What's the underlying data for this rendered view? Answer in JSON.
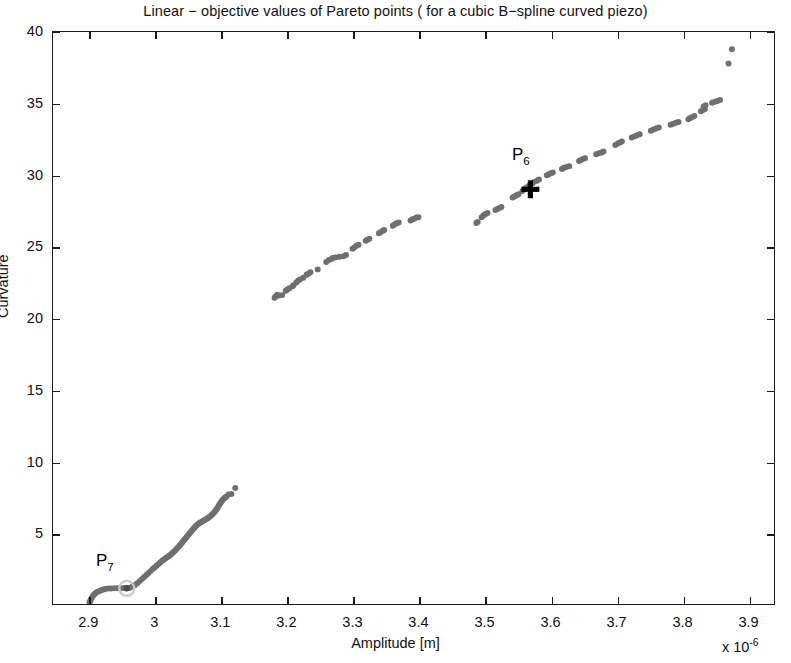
{
  "chart_data": {
    "type": "scatter",
    "title": "Linear − objective values of Pareto points ( for a cubic B−spline curved piezo)",
    "xlabel": "Amplitude [m]",
    "ylabel": "Curvature",
    "x_multiplier": "x 10",
    "x_multiplier_exponent": "-6",
    "xlim": [
      2.845,
      3.94
    ],
    "ylim": [
      0,
      40
    ],
    "xticks": [
      2.9,
      3.0,
      3.1,
      3.2,
      3.3,
      3.4,
      3.5,
      3.6,
      3.7,
      3.8,
      3.9
    ],
    "xtick_labels": [
      "2.9",
      "3",
      "3.1",
      "3.2",
      "3.3",
      "3.4",
      "3.5",
      "3.6",
      "3.7",
      "3.8",
      "3.9"
    ],
    "yticks": [
      5,
      10,
      15,
      20,
      25,
      30,
      35,
      40
    ],
    "ytick_labels": [
      "5",
      "10",
      "15",
      "20",
      "25",
      "30",
      "35",
      "40"
    ],
    "grid": false,
    "legend": null,
    "marker_color": "#6f6f6f",
    "marker_size": 3.0,
    "highlight_color": "#000000",
    "annotations": [
      {
        "label": "P",
        "subscript": "6",
        "x": 3.555,
        "y": 31.3,
        "marker_x": 3.57,
        "marker_y": 29.0,
        "marker_style": "plus"
      },
      {
        "label": "P",
        "subscript": "7",
        "x": 2.925,
        "y": 3.0,
        "marker_x": 2.957,
        "marker_y": 1.1,
        "marker_style": "circled-dot"
      }
    ],
    "series": [
      {
        "name": "lower-branch",
        "points": [
          [
            2.9005,
            0.1
          ],
          [
            2.9016,
            0.22
          ],
          [
            2.9028,
            0.33
          ],
          [
            2.9041,
            0.45
          ],
          [
            2.9058,
            0.58
          ],
          [
            2.9074,
            0.66
          ],
          [
            2.9092,
            0.74
          ],
          [
            2.9112,
            0.82
          ],
          [
            2.914,
            0.88
          ],
          [
            2.9172,
            0.95
          ],
          [
            2.9205,
            1.0
          ],
          [
            2.924,
            1.05
          ],
          [
            2.9285,
            1.08
          ],
          [
            2.933,
            1.09
          ],
          [
            2.938,
            1.1
          ],
          [
            2.943,
            1.1
          ],
          [
            2.948,
            1.11
          ],
          [
            2.953,
            1.12
          ],
          [
            2.957,
            1.11
          ],
          [
            2.961,
            1.12
          ],
          [
            2.965,
            1.2
          ],
          [
            2.969,
            1.32
          ],
          [
            2.973,
            1.45
          ],
          [
            2.9765,
            1.6
          ],
          [
            2.98,
            1.74
          ],
          [
            2.9835,
            1.88
          ],
          [
            2.9868,
            2.02
          ],
          [
            2.99,
            2.16
          ],
          [
            2.9932,
            2.3
          ],
          [
            2.9963,
            2.44
          ],
          [
            2.9994,
            2.56
          ],
          [
            3.0024,
            2.68
          ],
          [
            3.0053,
            2.8
          ],
          [
            3.0082,
            2.92
          ],
          [
            3.0108,
            3.02
          ],
          [
            3.0132,
            3.1
          ],
          [
            3.0155,
            3.18
          ],
          [
            3.0178,
            3.25
          ],
          [
            3.02,
            3.32
          ],
          [
            3.0222,
            3.4
          ],
          [
            3.0244,
            3.48
          ],
          [
            3.0266,
            3.58
          ],
          [
            3.0288,
            3.67
          ],
          [
            3.0308,
            3.76
          ],
          [
            3.0328,
            3.86
          ],
          [
            3.0347,
            3.96
          ],
          [
            3.0366,
            4.05
          ],
          [
            3.0384,
            4.15
          ],
          [
            3.0402,
            4.25
          ],
          [
            3.042,
            4.35
          ],
          [
            3.0438,
            4.45
          ],
          [
            3.0456,
            4.55
          ],
          [
            3.0474,
            4.65
          ],
          [
            3.0492,
            4.75
          ],
          [
            3.051,
            4.86
          ],
          [
            3.0528,
            4.96
          ],
          [
            3.0546,
            5.06
          ],
          [
            3.0563,
            5.16
          ],
          [
            3.058,
            5.25
          ],
          [
            3.0597,
            5.34
          ],
          [
            3.0614,
            5.42
          ],
          [
            3.0632,
            5.5
          ],
          [
            3.065,
            5.57
          ],
          [
            3.067,
            5.64
          ],
          [
            3.069,
            5.7
          ],
          [
            3.0711,
            5.76
          ],
          [
            3.0733,
            5.82
          ],
          [
            3.0755,
            5.88
          ],
          [
            3.0778,
            5.94
          ],
          [
            3.08,
            6.0
          ],
          [
            3.0822,
            6.08
          ],
          [
            3.0843,
            6.16
          ],
          [
            3.0863,
            6.24
          ],
          [
            3.0882,
            6.33
          ],
          [
            3.09,
            6.42
          ],
          [
            3.0917,
            6.52
          ],
          [
            3.0933,
            6.62
          ],
          [
            3.0948,
            6.72
          ],
          [
            3.0962,
            6.83
          ],
          [
            3.0976,
            6.94
          ],
          [
            3.099,
            7.04
          ],
          [
            3.1004,
            7.14
          ],
          [
            3.1018,
            7.23
          ],
          [
            3.1032,
            7.31
          ],
          [
            3.1048,
            7.38
          ],
          [
            3.1064,
            7.44
          ],
          [
            3.1081,
            7.5
          ],
          [
            3.1113,
            7.66
          ],
          [
            3.116,
            7.7
          ],
          [
            3.1218,
            8.12
          ]
        ]
      },
      {
        "name": "upper-branch",
        "points": [
          [
            3.1815,
            21.42
          ],
          [
            3.1828,
            21.48
          ],
          [
            3.1855,
            21.62
          ],
          [
            3.188,
            21.58
          ],
          [
            3.193,
            21.6
          ],
          [
            3.1985,
            21.9
          ],
          [
            3.201,
            22.0
          ],
          [
            3.204,
            22.08
          ],
          [
            3.209,
            22.22
          ],
          [
            3.2105,
            22.3
          ],
          [
            3.2145,
            22.48
          ],
          [
            3.2175,
            22.62
          ],
          [
            3.22,
            22.7
          ],
          [
            3.225,
            22.82
          ],
          [
            3.23,
            23.02
          ],
          [
            3.233,
            23.12
          ],
          [
            3.236,
            23.2
          ],
          [
            3.247,
            23.4
          ],
          [
            3.26,
            23.92
          ],
          [
            3.264,
            24.05
          ],
          [
            3.268,
            24.12
          ],
          [
            3.27,
            24.2
          ],
          [
            3.2745,
            24.25
          ],
          [
            3.28,
            24.28
          ],
          [
            3.286,
            24.32
          ],
          [
            3.29,
            24.4
          ],
          [
            3.3,
            24.85
          ],
          [
            3.303,
            24.95
          ],
          [
            3.306,
            25.05
          ],
          [
            3.309,
            25.12
          ],
          [
            3.32,
            25.4
          ],
          [
            3.3225,
            25.48
          ],
          [
            3.3255,
            25.55
          ],
          [
            3.34,
            25.92
          ],
          [
            3.343,
            26.02
          ],
          [
            3.346,
            26.1
          ],
          [
            3.348,
            26.15
          ],
          [
            3.361,
            26.45
          ],
          [
            3.364,
            26.55
          ],
          [
            3.367,
            26.62
          ],
          [
            3.37,
            26.68
          ],
          [
            3.388,
            26.82
          ],
          [
            3.391,
            26.9
          ],
          [
            3.394,
            26.95
          ],
          [
            3.397,
            27.02
          ],
          [
            3.4,
            27.05
          ],
          [
            3.488,
            26.65
          ],
          [
            3.49,
            26.72
          ],
          [
            3.496,
            27.05
          ],
          [
            3.499,
            27.18
          ],
          [
            3.502,
            27.28
          ],
          [
            3.505,
            27.35
          ],
          [
            3.517,
            27.55
          ],
          [
            3.52,
            27.62
          ],
          [
            3.523,
            27.7
          ],
          [
            3.526,
            27.76
          ],
          [
            3.543,
            28.42
          ],
          [
            3.546,
            28.5
          ],
          [
            3.549,
            28.58
          ],
          [
            3.552,
            28.65
          ],
          [
            3.558,
            28.88
          ],
          [
            3.562,
            29.05
          ],
          [
            3.565,
            29.15
          ],
          [
            3.568,
            29.25
          ],
          [
            3.573,
            29.42
          ],
          [
            3.576,
            29.52
          ],
          [
            3.58,
            29.6
          ],
          [
            3.583,
            29.68
          ],
          [
            3.595,
            29.98
          ],
          [
            3.598,
            30.05
          ],
          [
            3.601,
            30.12
          ],
          [
            3.604,
            30.18
          ],
          [
            3.618,
            30.42
          ],
          [
            3.621,
            30.5
          ],
          [
            3.625,
            30.56
          ],
          [
            3.629,
            30.62
          ],
          [
            3.644,
            30.98
          ],
          [
            3.647,
            31.05
          ],
          [
            3.65,
            31.12
          ],
          [
            3.653,
            31.18
          ],
          [
            3.67,
            31.45
          ],
          [
            3.674,
            31.52
          ],
          [
            3.678,
            31.58
          ],
          [
            3.681,
            31.65
          ],
          [
            3.699,
            32.1
          ],
          [
            3.703,
            32.2
          ],
          [
            3.706,
            32.28
          ],
          [
            3.709,
            32.35
          ],
          [
            3.724,
            32.62
          ],
          [
            3.728,
            32.7
          ],
          [
            3.732,
            32.78
          ],
          [
            3.736,
            32.85
          ],
          [
            3.753,
            33.1
          ],
          [
            3.757,
            33.18
          ],
          [
            3.761,
            33.25
          ],
          [
            3.765,
            33.32
          ],
          [
            3.783,
            33.52
          ],
          [
            3.787,
            33.58
          ],
          [
            3.791,
            33.65
          ],
          [
            3.795,
            33.7
          ],
          [
            3.81,
            33.9
          ],
          [
            3.813,
            33.98
          ],
          [
            3.816,
            34.05
          ],
          [
            3.819,
            34.12
          ],
          [
            3.829,
            34.45
          ],
          [
            3.832,
            34.55
          ],
          [
            3.835,
            34.62
          ],
          [
            3.833,
            34.78
          ],
          [
            3.836,
            34.88
          ],
          [
            3.846,
            35.05
          ],
          [
            3.85,
            35.12
          ],
          [
            3.854,
            35.18
          ],
          [
            3.858,
            35.25
          ],
          [
            3.871,
            37.8
          ],
          [
            3.876,
            38.8
          ]
        ]
      }
    ]
  }
}
